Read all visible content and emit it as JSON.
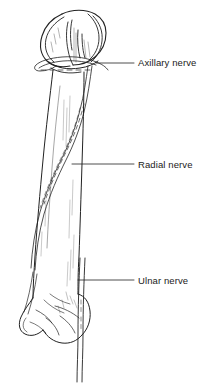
{
  "figure": {
    "background_color": "#ffffff",
    "line_color": "#222222",
    "text_color": "#1a1a1a"
  },
  "labels": [
    {
      "id": "axillary",
      "text": "Axillary nerve",
      "leader_from": [
        96,
        63
      ],
      "leader_to": [
        134,
        63
      ]
    },
    {
      "id": "radial",
      "text": "Radial nerve",
      "leader_from": [
        72,
        164
      ],
      "leader_to": [
        134,
        164
      ]
    },
    {
      "id": "ulnar",
      "text": "Ulnar nerve",
      "leader_from": [
        78,
        280
      ],
      "leader_to": [
        134,
        280
      ]
    }
  ]
}
